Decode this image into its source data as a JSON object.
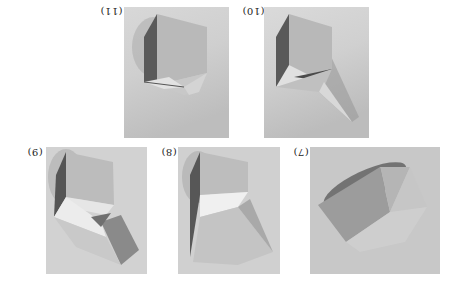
{
  "figure": {
    "orientation": "rotated 180 degrees",
    "panels": [
      {
        "id": "step-11",
        "label": "(11)",
        "description": "Cube with partially folded base flaps"
      },
      {
        "id": "step-10",
        "label": "(10)",
        "description": "Cube with an extended triangular flap to the lower right"
      },
      {
        "id": "step-9",
        "label": "(9)",
        "description": "Cube atop a twisted lower section"
      },
      {
        "id": "step-8",
        "label": "(8)",
        "description": "Cube with a partially collapsed lower prism"
      },
      {
        "id": "step-7",
        "label": "(7)",
        "description": "Tilted folded paper form with triangular facets"
      }
    ]
  },
  "colors": {
    "background": "#ffffff",
    "photo_light": "#e6e6e6",
    "photo_mid": "#b8b8b8",
    "photo_dark": "#6e6e6e",
    "label_text": "#222222"
  }
}
